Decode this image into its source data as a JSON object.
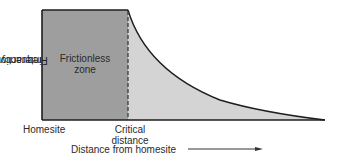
{
  "diagram": {
    "y_axis_label_line1": "Frequency of",
    "y_axis_label_line2": "interaction",
    "zone_label_line1": "Frictionless",
    "zone_label_line2": "zone",
    "x_tick_homesite": "Homesite",
    "x_tick_critical_line1": "Critical",
    "x_tick_critical_line2": "distance",
    "x_axis_label": "Distance from homesite",
    "colors": {
      "frictionless_fill": "#9e9e9e",
      "decay_fill": "#d4d4d4",
      "stroke": "#1e1e1e"
    }
  }
}
